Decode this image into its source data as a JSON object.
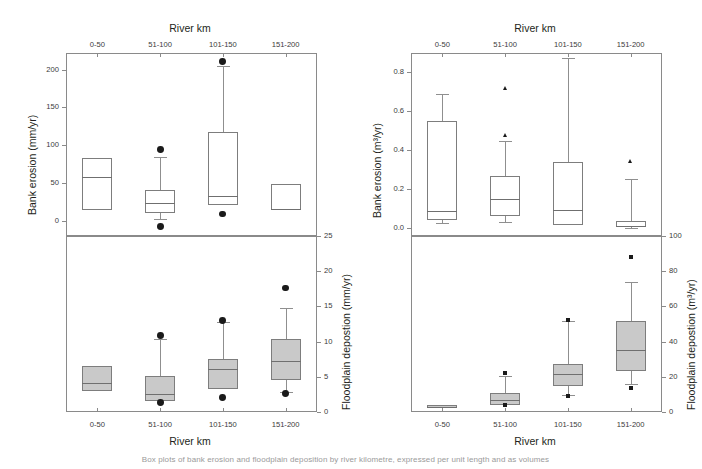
{
  "figure": {
    "caption_fragment": "Box plots of bank erosion and floodplain deposition by river kilometre, expressed per unit length and as volumes"
  },
  "categories": [
    "0-50",
    "51-100",
    "101-150",
    "151-200"
  ],
  "axis_title_top": "River km",
  "axis_title_bottom": "River km",
  "panels": {
    "top_left": {
      "ylabel": "Bank erosion (mm/yr)",
      "yticks": [
        "0",
        "50",
        "100",
        "150",
        "200"
      ],
      "ytick_values": [
        0,
        50,
        100,
        150,
        200
      ],
      "ylim": [
        -20,
        222
      ],
      "axis_side": "left"
    },
    "top_right": {
      "ylabel": "Bank erosion (m³/yr)",
      "yticks": [
        "0.0",
        "0.2",
        "0.4",
        "0.6",
        "0.8"
      ],
      "ytick_values": [
        0.0,
        0.2,
        0.4,
        0.6,
        0.8
      ],
      "ylim": [
        -0.04,
        0.9
      ],
      "axis_side": "left"
    },
    "bottom_left": {
      "ylabel": "Floodplain depostion (mm/yr)",
      "yticks": [
        "0",
        "5",
        "10",
        "15",
        "20",
        "25"
      ],
      "ytick_values": [
        0,
        5,
        10,
        15,
        20,
        25
      ],
      "ylim": [
        0,
        25
      ],
      "axis_side": "right"
    },
    "bottom_right": {
      "ylabel": "Floodplain depostion (m³/yr)",
      "yticks": [
        "0",
        "20",
        "40",
        "60",
        "80",
        "100"
      ],
      "ytick_values": [
        0,
        20,
        40,
        60,
        80,
        100
      ],
      "ylim": [
        0,
        100
      ],
      "axis_side": "right"
    }
  },
  "chart_data": [
    {
      "type": "box",
      "panel": "top_left",
      "title": "Bank erosion (mm/yr) by river km",
      "xlabel": "River km",
      "ylabel": "Bank erosion (mm/yr)",
      "ylim": [
        -20,
        222
      ],
      "grid": false,
      "fill": "none",
      "categories": [
        "0-50",
        "51-100",
        "101-150",
        "151-200"
      ],
      "boxes": [
        {
          "category": "0-50",
          "whisker_low": 15,
          "q1": 15,
          "median": 58,
          "q3": 83,
          "whisker_high": 83,
          "outliers": []
        },
        {
          "category": "51-100",
          "whisker_low": 2,
          "q1": 10,
          "median": 24,
          "q3": 41,
          "whisker_high": 84,
          "outliers": [
            94,
            -7
          ]
        },
        {
          "category": "101-150",
          "whisker_low": 21,
          "q1": 21,
          "median": 33,
          "q3": 117,
          "whisker_high": 205,
          "outliers": [
            211,
            9
          ]
        },
        {
          "category": "151-200",
          "whisker_low": 14,
          "q1": 14,
          "median": 16,
          "q3": 49,
          "whisker_high": 49,
          "outliers": []
        }
      ]
    },
    {
      "type": "box",
      "panel": "top_right",
      "title": "Bank erosion (m³/yr) by river km",
      "xlabel": "River km",
      "ylabel": "Bank erosion (m³/yr)",
      "ylim": [
        -0.04,
        0.9
      ],
      "grid": false,
      "fill": "none",
      "categories": [
        "0-50",
        "51-100",
        "101-150",
        "151-200"
      ],
      "boxes": [
        {
          "category": "0-50",
          "whisker_low": 0.025,
          "q1": 0.04,
          "median": 0.09,
          "q3": 0.55,
          "whisker_high": 0.69,
          "outliers": []
        },
        {
          "category": "51-100",
          "whisker_low": 0.03,
          "q1": 0.065,
          "median": 0.15,
          "q3": 0.27,
          "whisker_high": 0.45,
          "outliers": [
            0.71,
            0.465
          ]
        },
        {
          "category": "101-150",
          "whisker_low": 0.015,
          "q1": 0.015,
          "median": 0.095,
          "q3": 0.34,
          "whisker_high": 0.875,
          "outliers": []
        },
        {
          "category": "151-200",
          "whisker_low": 0.0,
          "q1": 0.005,
          "median": 0.01,
          "q3": 0.035,
          "whisker_high": 0.255,
          "outliers": [
            0.335
          ]
        }
      ]
    },
    {
      "type": "box",
      "panel": "bottom_left",
      "title": "Floodplain depostion (mm/yr) by river km",
      "xlabel": "River km",
      "ylabel": "Floodplain depostion (mm/yr)",
      "ylim": [
        0,
        25
      ],
      "grid": false,
      "fill": "#c9c9c9",
      "categories": [
        "0-50",
        "51-100",
        "101-150",
        "151-200"
      ],
      "boxes": [
        {
          "category": "0-50",
          "whisker_low": 3.0,
          "q1": 3.0,
          "median": 4.1,
          "q3": 6.6,
          "whisker_high": 6.6,
          "outliers": []
        },
        {
          "category": "51-100",
          "whisker_low": 1.6,
          "q1": 1.6,
          "median": 2.6,
          "q3": 5.1,
          "whisker_high": 10.3,
          "outliers": [
            10.9,
            1.4
          ]
        },
        {
          "category": "101-150",
          "whisker_low": 3.3,
          "q1": 3.3,
          "median": 6.1,
          "q3": 7.5,
          "whisker_high": 12.8,
          "outliers": [
            13.0,
            2.1
          ]
        },
        {
          "category": "151-200",
          "whisker_low": 2.8,
          "q1": 4.6,
          "median": 7.3,
          "q3": 10.3,
          "whisker_high": 14.8,
          "outliers": [
            17.6,
            2.6
          ]
        }
      ]
    },
    {
      "type": "box",
      "panel": "bottom_right",
      "title": "Floodplain depostion (m³/yr) by river km",
      "xlabel": "River km",
      "ylabel": "Floodplain depostion (m³/yr)",
      "ylim": [
        0,
        100
      ],
      "grid": false,
      "fill": "#c9c9c9",
      "categories": [
        "0-50",
        "51-100",
        "101-150",
        "151-200"
      ],
      "boxes": [
        {
          "category": "0-50",
          "whisker_low": 2.0,
          "q1": 2.0,
          "median": 2.9,
          "q3": 4.0,
          "whisker_high": 4.0,
          "outliers": []
        },
        {
          "category": "51-100",
          "whisker_low": 4.2,
          "q1": 4.2,
          "median": 6.6,
          "q3": 11.0,
          "whisker_high": 20.5,
          "outliers": [
            22.0,
            4.0
          ]
        },
        {
          "category": "101-150",
          "whisker_low": 9.5,
          "q1": 14.5,
          "median": 21.5,
          "q3": 27.5,
          "whisker_high": 51.5,
          "outliers": [
            52.5,
            9.0
          ]
        },
        {
          "category": "151-200",
          "whisker_low": 16.0,
          "q1": 23.5,
          "median": 35.5,
          "q3": 51.5,
          "whisker_high": 74.0,
          "outliers": [
            88.0,
            13.5
          ]
        }
      ]
    }
  ]
}
